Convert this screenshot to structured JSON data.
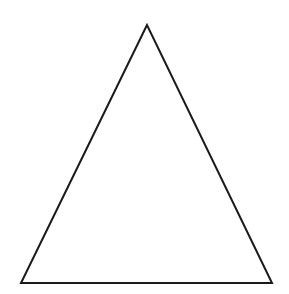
{
  "diagram": {
    "shape": "triangle",
    "type": "isosceles",
    "vertices": [
      [
        147,
        25
      ],
      [
        21,
        283
      ],
      [
        272,
        283
      ]
    ],
    "stroke_color": "#1a1a1a",
    "stroke_width": 2,
    "fill": "none",
    "background": "#ffffff"
  }
}
